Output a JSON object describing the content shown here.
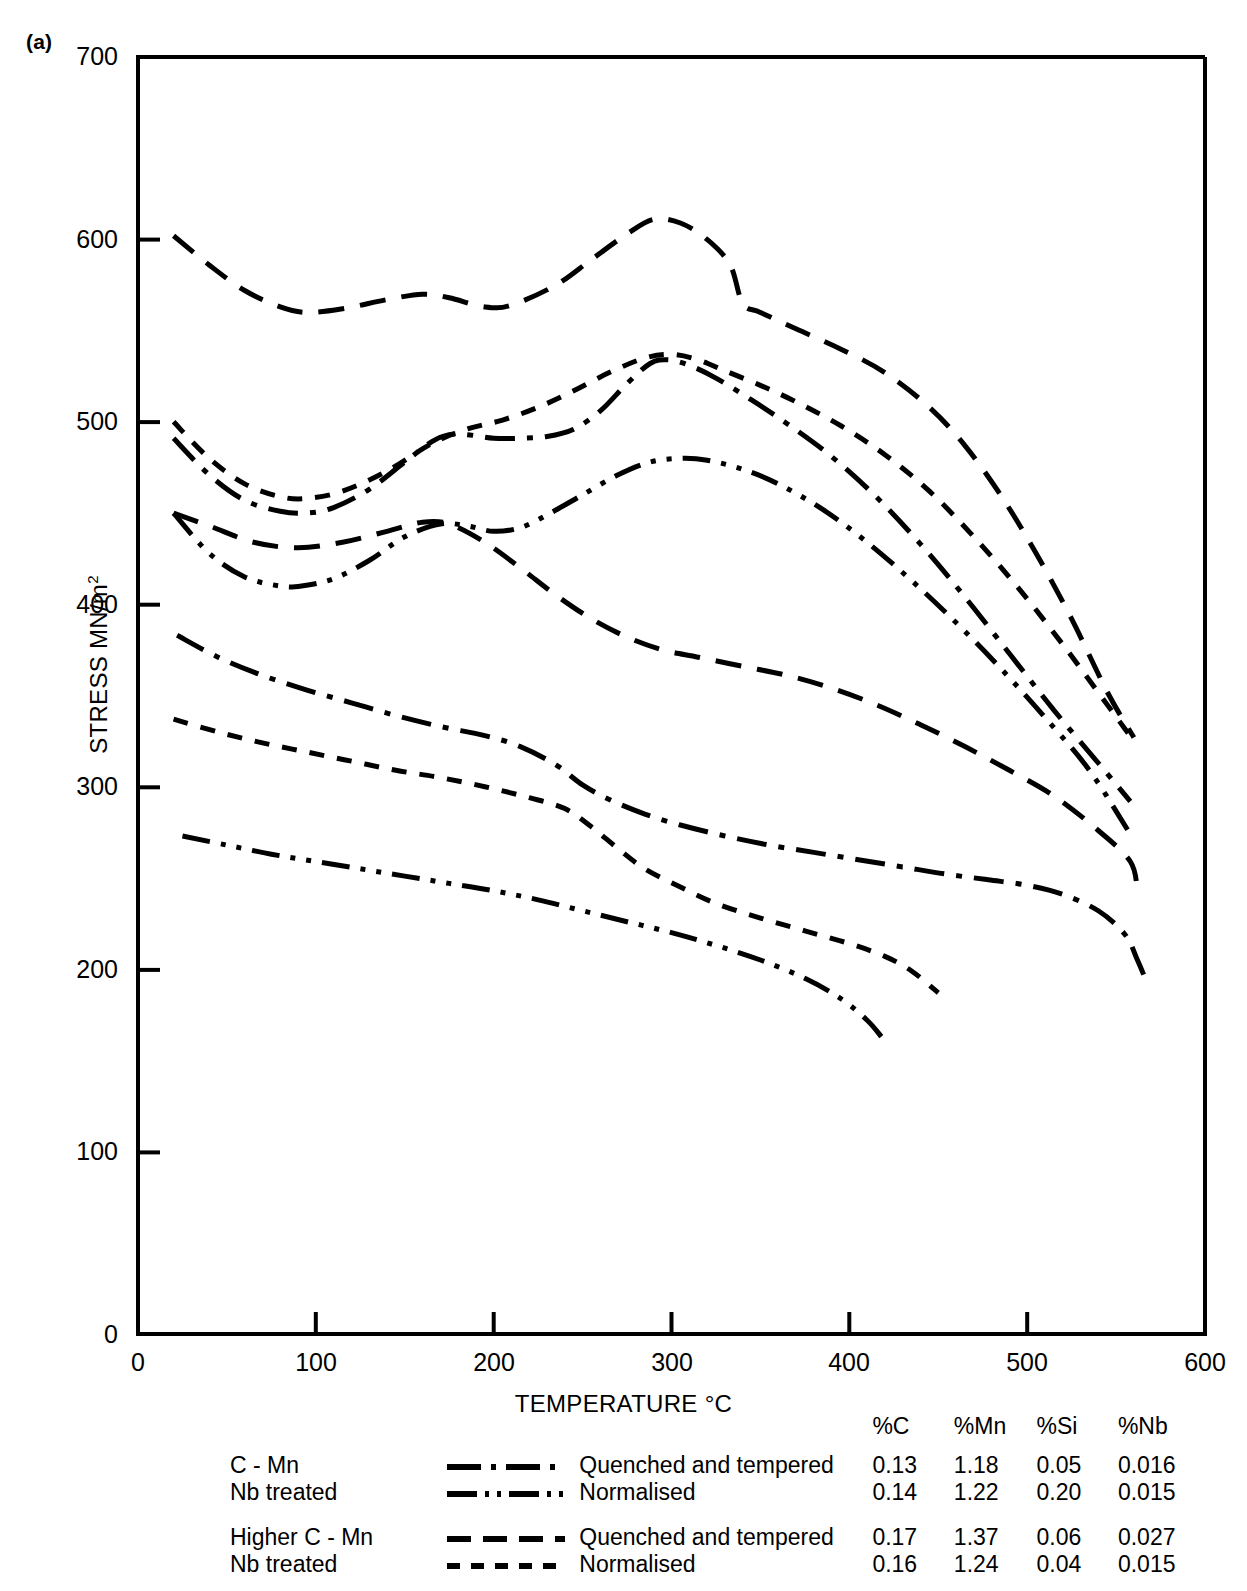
{
  "panel": {
    "label": "(a)"
  },
  "axes": {
    "ytitle_main": "STRESS MN/m",
    "ytitle_sup": "2",
    "xtitle": "TEMPERATURE °C",
    "yticks": [
      "700",
      "600",
      "500",
      "400",
      "300",
      "200",
      "100",
      "0"
    ],
    "xticks": [
      "0",
      "100",
      "200",
      "300",
      "400",
      "500",
      "600"
    ]
  },
  "legend": {
    "headers": [
      "",
      "",
      "",
      "%C",
      "%Mn",
      "%Si",
      "%Nb"
    ],
    "rows": [
      {
        "name": "C - Mn",
        "style": "dash-dot",
        "condition": "Quenched and tempered",
        "C": "0.13",
        "Mn": "1.18",
        "Si": "0.05",
        "Nb": "0.016"
      },
      {
        "name": "Nb treated",
        "style": "dash-dot-dot",
        "condition": "Normalised",
        "C": "0.14",
        "Mn": "1.22",
        "Si": "0.20",
        "Nb": "0.015"
      },
      {
        "name": "Higher C - Mn",
        "style": "long-dash",
        "condition": "Quenched and tempered",
        "C": "0.17",
        "Mn": "1.37",
        "Si": "0.06",
        "Nb": "0.027"
      },
      {
        "name": "Nb treated",
        "style": "short-dash",
        "condition": "Normalised",
        "C": "0.16",
        "Mn": "1.24",
        "Si": "0.04",
        "Nb": "0.015"
      }
    ]
  },
  "chart_data": {
    "type": "line",
    "title": "(a)",
    "xlabel": "TEMPERATURE °C",
    "ylabel": "STRESS MN/m2",
    "xlim": [
      0,
      600
    ],
    "ylim": [
      0,
      700
    ],
    "xticks": [
      0,
      100,
      200,
      300,
      400,
      500,
      600
    ],
    "yticks": [
      0,
      100,
      200,
      300,
      400,
      500,
      600,
      700
    ],
    "grid": false,
    "legend_position": "below-axes",
    "series": [
      {
        "name": "Higher C - Mn, Quenched and tempered (UTS)",
        "style": "long-dash",
        "points": [
          [
            20,
            602
          ],
          [
            40,
            586
          ],
          [
            60,
            572
          ],
          [
            80,
            563
          ],
          [
            95,
            560
          ],
          [
            115,
            562
          ],
          [
            140,
            567
          ],
          [
            160,
            570
          ],
          [
            175,
            568
          ],
          [
            195,
            563
          ],
          [
            210,
            564
          ],
          [
            235,
            575
          ],
          [
            255,
            589
          ],
          [
            275,
            603
          ],
          [
            290,
            611
          ],
          [
            305,
            609
          ],
          [
            320,
            600
          ],
          [
            333,
            586
          ],
          [
            340,
            565
          ],
          [
            350,
            560
          ],
          [
            370,
            551
          ],
          [
            395,
            540
          ],
          [
            420,
            527
          ],
          [
            445,
            508
          ],
          [
            465,
            487
          ],
          [
            485,
            460
          ],
          [
            505,
            428
          ],
          [
            525,
            392
          ],
          [
            545,
            352
          ],
          [
            560,
            327
          ]
        ]
      },
      {
        "name": "Nb treated, Normalised (UTS)",
        "style": "short-dash",
        "points": [
          [
            20,
            500
          ],
          [
            40,
            480
          ],
          [
            60,
            466
          ],
          [
            80,
            459
          ],
          [
            95,
            458
          ],
          [
            115,
            462
          ],
          [
            140,
            473
          ],
          [
            165,
            488
          ],
          [
            185,
            496
          ],
          [
            205,
            501
          ],
          [
            225,
            508
          ],
          [
            245,
            517
          ],
          [
            265,
            527
          ],
          [
            285,
            535
          ],
          [
            300,
            537
          ],
          [
            315,
            534
          ],
          [
            330,
            528
          ],
          [
            350,
            520
          ],
          [
            370,
            511
          ],
          [
            395,
            498
          ],
          [
            420,
            482
          ],
          [
            445,
            462
          ],
          [
            470,
            437
          ],
          [
            495,
            409
          ],
          [
            520,
            378
          ],
          [
            545,
            345
          ],
          [
            560,
            325
          ]
        ]
      },
      {
        "name": "C - Mn, Quenched and tempered (UTS)",
        "style": "dash-dot",
        "points": [
          [
            20,
            491
          ],
          [
            40,
            471
          ],
          [
            60,
            457
          ],
          [
            80,
            451
          ],
          [
            95,
            450
          ],
          [
            110,
            453
          ],
          [
            130,
            463
          ],
          [
            150,
            478
          ],
          [
            165,
            489
          ],
          [
            175,
            493
          ],
          [
            185,
            493
          ],
          [
            200,
            491
          ],
          [
            215,
            491
          ],
          [
            230,
            492
          ],
          [
            245,
            496
          ],
          [
            260,
            506
          ],
          [
            275,
            521
          ],
          [
            288,
            532
          ],
          [
            298,
            534
          ],
          [
            310,
            531
          ],
          [
            325,
            524
          ],
          [
            345,
            512
          ],
          [
            365,
            499
          ],
          [
            390,
            481
          ],
          [
            415,
            459
          ],
          [
            440,
            433
          ],
          [
            465,
            404
          ],
          [
            490,
            373
          ],
          [
            515,
            342
          ],
          [
            540,
            313
          ],
          [
            558,
            292
          ]
        ]
      },
      {
        "name": "Nb treated, Normalised upper (UTS)",
        "style": "dash-dot-dot",
        "points": [
          [
            20,
            450
          ],
          [
            40,
            428
          ],
          [
            60,
            415
          ],
          [
            80,
            410
          ],
          [
            92,
            410
          ],
          [
            110,
            414
          ],
          [
            130,
            424
          ],
          [
            150,
            437
          ],
          [
            170,
            444
          ],
          [
            185,
            443
          ],
          [
            200,
            440
          ],
          [
            215,
            442
          ],
          [
            230,
            449
          ],
          [
            250,
            460
          ],
          [
            270,
            471
          ],
          [
            288,
            478
          ],
          [
            305,
            480
          ],
          [
            320,
            479
          ],
          [
            340,
            474
          ],
          [
            360,
            466
          ],
          [
            385,
            452
          ],
          [
            410,
            434
          ],
          [
            435,
            413
          ],
          [
            460,
            390
          ],
          [
            485,
            365
          ],
          [
            510,
            338
          ],
          [
            535,
            309
          ],
          [
            558,
            274
          ]
        ]
      },
      {
        "name": "Higher C - Mn, Quenched and tempered (yield)",
        "style": "long-dash",
        "points": [
          [
            20,
            450
          ],
          [
            40,
            443
          ],
          [
            65,
            434
          ],
          [
            90,
            431
          ],
          [
            115,
            434
          ],
          [
            140,
            440
          ],
          [
            160,
            445
          ],
          [
            175,
            444
          ],
          [
            195,
            434
          ],
          [
            215,
            420
          ],
          [
            235,
            405
          ],
          [
            255,
            392
          ],
          [
            275,
            382
          ],
          [
            295,
            375
          ],
          [
            315,
            371
          ],
          [
            340,
            366
          ],
          [
            365,
            361
          ],
          [
            390,
            354
          ],
          [
            415,
            345
          ],
          [
            440,
            334
          ],
          [
            465,
            322
          ],
          [
            490,
            309
          ],
          [
            515,
            295
          ],
          [
            540,
            276
          ],
          [
            558,
            259
          ],
          [
            562,
            243
          ]
        ]
      },
      {
        "name": "C - Mn, Quenched and tempered (yield)",
        "style": "dash-dot",
        "points": [
          [
            22,
            383
          ],
          [
            45,
            371
          ],
          [
            70,
            361
          ],
          [
            95,
            353
          ],
          [
            120,
            346
          ],
          [
            145,
            339
          ],
          [
            170,
            333
          ],
          [
            195,
            328
          ],
          [
            215,
            322
          ],
          [
            235,
            312
          ],
          [
            250,
            301
          ],
          [
            265,
            293
          ],
          [
            285,
            285
          ],
          [
            305,
            279
          ],
          [
            330,
            273
          ],
          [
            355,
            268
          ],
          [
            380,
            264
          ],
          [
            405,
            260
          ],
          [
            430,
            256
          ],
          [
            455,
            252
          ],
          [
            478,
            249
          ],
          [
            500,
            246
          ],
          [
            520,
            241
          ],
          [
            540,
            232
          ],
          [
            555,
            219
          ],
          [
            562,
            205
          ],
          [
            568,
            191
          ]
        ]
      },
      {
        "name": "Nb treated, Normalised (yield)",
        "style": "short-dash",
        "points": [
          [
            20,
            337
          ],
          [
            45,
            330
          ],
          [
            70,
            324
          ],
          [
            95,
            319
          ],
          [
            120,
            314
          ],
          [
            145,
            309
          ],
          [
            170,
            305
          ],
          [
            195,
            300
          ],
          [
            220,
            294
          ],
          [
            240,
            288
          ],
          [
            255,
            278
          ],
          [
            270,
            266
          ],
          [
            285,
            255
          ],
          [
            305,
            245
          ],
          [
            325,
            236
          ],
          [
            350,
            228
          ],
          [
            375,
            221
          ],
          [
            400,
            214
          ],
          [
            420,
            207
          ],
          [
            435,
            199
          ],
          [
            450,
            187
          ]
        ]
      },
      {
        "name": "Nb treated, Normalised lower (yield)",
        "style": "dash-dot-dot",
        "points": [
          [
            25,
            273
          ],
          [
            50,
            268
          ],
          [
            75,
            263
          ],
          [
            100,
            259
          ],
          [
            125,
            255
          ],
          [
            150,
            251
          ],
          [
            175,
            247
          ],
          [
            200,
            243
          ],
          [
            225,
            238
          ],
          [
            250,
            232
          ],
          [
            275,
            226
          ],
          [
            300,
            220
          ],
          [
            325,
            213
          ],
          [
            350,
            205
          ],
          [
            375,
            195
          ],
          [
            395,
            184
          ],
          [
            410,
            172
          ],
          [
            418,
            163
          ]
        ]
      }
    ]
  }
}
